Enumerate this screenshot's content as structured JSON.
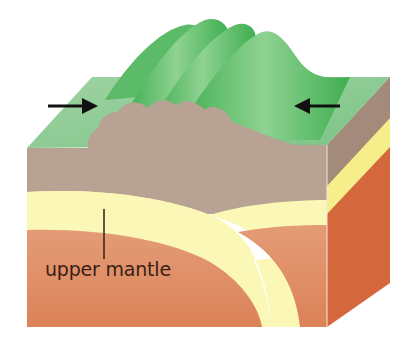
{
  "diagram": {
    "labels": {
      "upper_mantle": "upper mantle"
    },
    "arrows": [
      {
        "name": "left-compression-arrow",
        "direction": "right"
      },
      {
        "name": "right-compression-arrow",
        "direction": "left"
      }
    ],
    "colors": {
      "surface_green": "#8cc893",
      "ridge_green": "#4cb35a",
      "crust": "#b8a293",
      "crust_side": "#a38b7b",
      "lithosphere_yellow": "#fbf7b6",
      "side_yellow": "#f5ee8a",
      "mantle": "#de8a63",
      "mantle_side": "#d4683c",
      "arrow": "#111111",
      "text": "#3a1e14"
    }
  }
}
